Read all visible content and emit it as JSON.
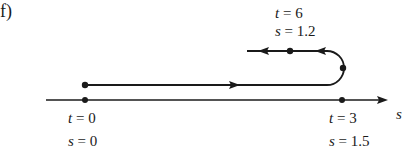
{
  "figure": {
    "panel_label": "f)",
    "axis_label": "s",
    "points": [
      {
        "id": "start",
        "t_label": "t",
        "t_value": "0",
        "s_label": "s",
        "s_value": "0"
      },
      {
        "id": "turn",
        "t_label": "t",
        "t_value": "3",
        "s_label": "s",
        "s_value": "1.5"
      },
      {
        "id": "end",
        "t_label": "t",
        "t_value": "6",
        "s_label": "s",
        "s_value": "1.2"
      }
    ],
    "eq": "="
  },
  "colors": {
    "ink": "#1a1a1a",
    "background": "#ffffff"
  }
}
